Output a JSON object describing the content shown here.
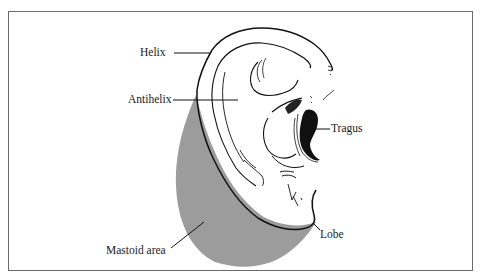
{
  "diagram": {
    "colors": {
      "frame": "#6a6a6a",
      "line": "#111111",
      "mastoid_fill": "#9c9c9c",
      "background": "#ffffff"
    },
    "labels": {
      "helix": "Helix",
      "antihelix": "Antihelix",
      "tragus": "Tragus",
      "mastoid": "Mastoid area",
      "lobe": "Lobe"
    }
  }
}
